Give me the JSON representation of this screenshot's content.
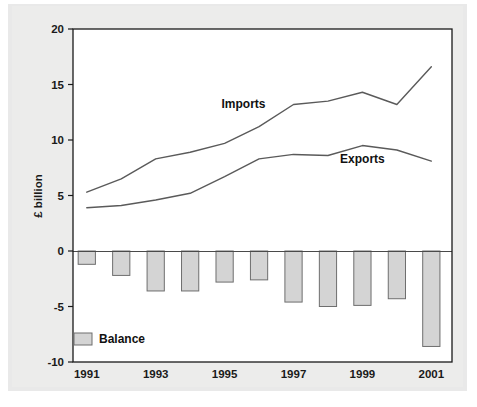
{
  "chart_data": {
    "type": "line",
    "title": "",
    "subtitle": "",
    "xlabel": "",
    "ylabel": "£ billion",
    "x": [
      1991,
      1992,
      1993,
      1994,
      1995,
      1996,
      1997,
      1998,
      1999,
      2000,
      2001
    ],
    "xtick_labels": [
      "1991",
      "1993",
      "1995",
      "1997",
      "1999",
      "2001"
    ],
    "xticks": [
      1991,
      1993,
      1995,
      1997,
      1999,
      2001
    ],
    "xlim": [
      1990.6,
      2001.6
    ],
    "ytick_labels": [
      "20",
      "15",
      "10",
      "5",
      "0",
      "-5",
      "-10"
    ],
    "yticks": [
      20,
      15,
      10,
      5,
      0,
      -5,
      -10
    ],
    "ylim": [
      -10,
      20
    ],
    "grid": false,
    "legend_position": "inside-bottom-left",
    "series": [
      {
        "name": "Imports",
        "type": "line",
        "label": "Imports",
        "color": "#5a5a5a",
        "values": [
          5.3,
          6.5,
          8.3,
          8.9,
          9.7,
          11.2,
          13.2,
          13.5,
          14.3,
          13.2,
          16.6
        ]
      },
      {
        "name": "Exports",
        "type": "line",
        "label": "Exports",
        "color": "#5a5a5a",
        "values": [
          3.9,
          4.1,
          4.6,
          5.2,
          6.7,
          8.3,
          8.7,
          8.6,
          9.5,
          9.1,
          8.1
        ]
      },
      {
        "name": "Balance",
        "type": "bar",
        "label": "Balance",
        "color": "#d4d4d4",
        "edge_color": "#6e6e6e",
        "values": [
          -1.2,
          -2.2,
          -3.6,
          -3.6,
          -2.8,
          -2.6,
          -4.6,
          -5.0,
          -4.9,
          -4.3,
          -8.6
        ]
      }
    ],
    "annotations": [
      {
        "text": "Imports",
        "x": 1995.55,
        "y": 12.9
      },
      {
        "text": "Exports",
        "x": 1999.0,
        "y": 7.9
      }
    ]
  },
  "legend": {
    "entries": [
      {
        "label": "Balance",
        "swatch_color": "#d4d4d4"
      }
    ]
  },
  "colors": {
    "plot_background": "#ffffff",
    "plate_background": "#e9e9e9",
    "axis": "#1a1a1a",
    "line": "#5a5a5a",
    "bar_fill": "#d4d4d4",
    "bar_edge": "#6e6e6e"
  }
}
